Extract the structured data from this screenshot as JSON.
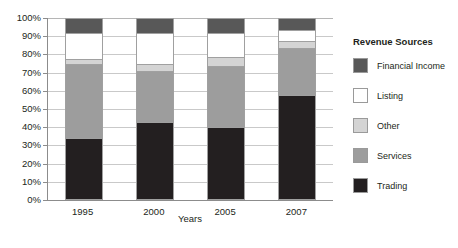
{
  "chart_data": {
    "type": "bar",
    "subtype": "100-percent-stacked-column",
    "title": "",
    "xlabel": "Years",
    "ylabel": "",
    "categories": [
      "1995",
      "2000",
      "2005",
      "2007"
    ],
    "ylim": [
      0,
      100
    ],
    "ytick_labels": [
      "0%",
      "10%",
      "20%",
      "30%",
      "40%",
      "50%",
      "60%",
      "70%",
      "80%",
      "90%",
      "100%"
    ],
    "ytick_values": [
      0,
      10,
      20,
      30,
      40,
      50,
      60,
      70,
      80,
      90,
      100
    ],
    "grid": true,
    "grid_axis": "y",
    "legend_position": "right",
    "legend_title": "Revenue Sources",
    "stack_order_bottom_to_top": [
      "Trading",
      "Services",
      "Other",
      "Listing",
      "Financial Income"
    ],
    "series": [
      {
        "name": "Trading",
        "color": "#231f20",
        "values": [
          34,
          43,
          40,
          58
        ]
      },
      {
        "name": "Services",
        "color": "#9d9d9d",
        "values": [
          41,
          28,
          34,
          26
        ]
      },
      {
        "name": "Other",
        "color": "#d4d4d4",
        "values": [
          3,
          4,
          5,
          4
        ]
      },
      {
        "name": "Listing",
        "color": "#ffffff",
        "values": [
          14,
          17,
          13,
          6
        ]
      },
      {
        "name": "Financial Income",
        "color": "#585858",
        "values": [
          8,
          8,
          8,
          6
        ]
      }
    ]
  },
  "axis": {
    "x_title": "Years",
    "ticks_y": [
      "100%",
      "90%",
      "80%",
      "70%",
      "60%",
      "50%",
      "40%",
      "30%",
      "20%",
      "10%",
      "0%"
    ],
    "ticks_x": [
      "1995",
      "2000",
      "2005",
      "2007"
    ]
  },
  "legend": {
    "title": "Revenue Sources",
    "items": [
      {
        "label": "Financial Income",
        "color": "#585858"
      },
      {
        "label": "Listing",
        "color": "#ffffff"
      },
      {
        "label": "Other",
        "color": "#d4d4d4"
      },
      {
        "label": "Services",
        "color": "#9d9d9d"
      },
      {
        "label": "Trading",
        "color": "#231f20"
      }
    ]
  }
}
